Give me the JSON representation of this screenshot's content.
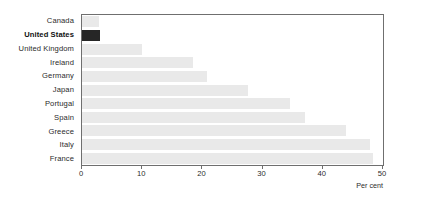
{
  "chart_data": {
    "type": "bar",
    "orientation": "horizontal",
    "title": "",
    "xlabel": "Per cent",
    "ylabel": "",
    "categories": [
      "Canada",
      "United States",
      "United Kingdom",
      "Ireland",
      "Germany",
      "Japan",
      "Portugal",
      "Spain",
      "Greece",
      "Italy",
      "France"
    ],
    "values": [
      2.8,
      3.0,
      10.0,
      18.5,
      20.8,
      27.5,
      34.5,
      37.0,
      43.8,
      47.8,
      48.3
    ],
    "xlim": [
      0,
      50
    ],
    "xticks": [
      0,
      10,
      20,
      30,
      40,
      50
    ],
    "xticklabels": [
      "0",
      "10",
      "20",
      "30",
      "40",
      "50"
    ],
    "grid": false,
    "legend": null,
    "highlighted_category": "United States",
    "colors": {
      "bar": "#e9e9e9",
      "highlight_bar": "#262626",
      "axis": "#6f6f6f",
      "text": "#2b2b2b",
      "background": "#ffffff"
    }
  }
}
